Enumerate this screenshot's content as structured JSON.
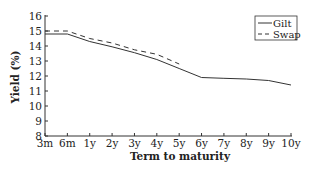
{
  "chart_data": {
    "type": "line",
    "title": "",
    "xlabel": "Term to maturity",
    "ylabel": "Yield (%)",
    "x": [
      "3m",
      "6m",
      "1y",
      "2y",
      "3y",
      "4y",
      "5y",
      "6y",
      "7y",
      "8y",
      "9y",
      "10y"
    ],
    "ylim": [
      8,
      16
    ],
    "yticks": [
      8,
      9,
      10,
      11,
      12,
      13,
      14,
      15,
      16
    ],
    "grid": false,
    "legend_position": "upper right",
    "series": [
      {
        "name": "Gilt",
        "style": "solid",
        "color": "#333333",
        "values": [
          14.8,
          14.8,
          14.3,
          13.95,
          13.55,
          13.1,
          12.5,
          11.9,
          11.85,
          11.8,
          11.7,
          11.4
        ]
      },
      {
        "name": "Swap",
        "style": "dashed",
        "color": "#333333",
        "values": [
          15.0,
          15.0,
          14.5,
          14.2,
          13.75,
          13.45,
          12.8,
          null,
          null,
          null,
          null,
          null
        ]
      }
    ]
  }
}
